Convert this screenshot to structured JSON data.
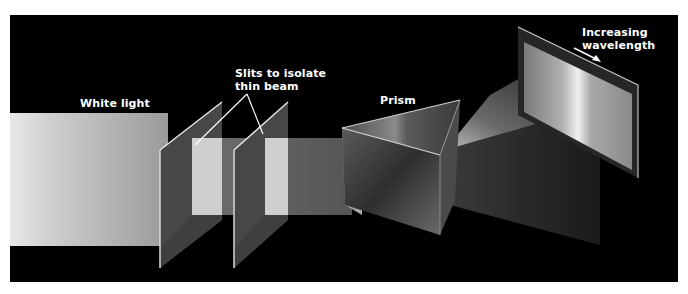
{
  "figure": {
    "background_color": "#000000",
    "page_color": "#ffffff",
    "labels": {
      "white_light": "White light",
      "slits_line1": "Slits to isolate",
      "slits_line2": "thin beam",
      "prism": "Prism",
      "wavelength_line1": "Increasing",
      "wavelength_line2": "wavelength"
    },
    "components": [
      {
        "name": "white-light-beam",
        "type": "light source beam"
      },
      {
        "name": "slit-1",
        "type": "slit panel"
      },
      {
        "name": "slit-2",
        "type": "slit panel"
      },
      {
        "name": "thin-beam",
        "type": "isolated beam"
      },
      {
        "name": "prism",
        "type": "triangular prism"
      },
      {
        "name": "dispersed-beam",
        "type": "spread spectrum"
      },
      {
        "name": "screen",
        "type": "projection screen"
      },
      {
        "name": "wavelength-arrow",
        "type": "arrow"
      }
    ]
  }
}
